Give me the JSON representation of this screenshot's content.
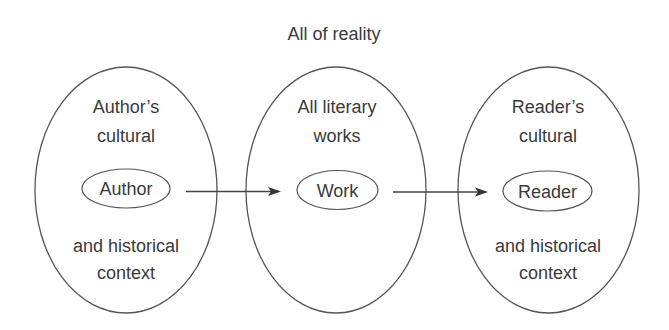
{
  "diagram": {
    "title": "All of reality",
    "colors": {
      "stroke": "#555555",
      "text": "#3a3a3a",
      "background": "#ffffff"
    },
    "spheres": [
      {
        "id": "author-sphere",
        "top_lines": [
          "Author’s",
          "cultural"
        ],
        "bottom_lines": [
          "and historical",
          "context"
        ],
        "node": "Author"
      },
      {
        "id": "work-sphere",
        "top_lines": [
          "All literary",
          "works"
        ],
        "bottom_lines": [],
        "node": "Work"
      },
      {
        "id": "reader-sphere",
        "top_lines": [
          "Reader’s",
          "cultural"
        ],
        "bottom_lines": [
          "and historical",
          "context"
        ],
        "node": "Reader"
      }
    ],
    "edges": [
      {
        "from": "Author",
        "to": "Work",
        "icon": "arrow-right-icon"
      },
      {
        "from": "Work",
        "to": "Reader",
        "icon": "arrow-right-icon"
      }
    ]
  }
}
